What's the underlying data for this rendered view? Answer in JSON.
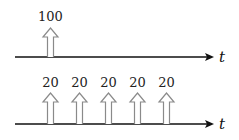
{
  "diagram": {
    "axis_color": "#111111",
    "arrow_stroke": "#8a8a8a",
    "rows": [
      {
        "name": "single-impulse",
        "axis_label": "t",
        "axis_y": 57,
        "impulses": [
          {
            "x": 50,
            "value": "100"
          }
        ]
      },
      {
        "name": "impulse-train",
        "axis_label": "t",
        "axis_y": 124,
        "impulses": [
          {
            "x": 50,
            "value": "20"
          },
          {
            "x": 79,
            "value": "20"
          },
          {
            "x": 108,
            "value": "20"
          },
          {
            "x": 137,
            "value": "20"
          },
          {
            "x": 166,
            "value": "20"
          }
        ]
      }
    ]
  }
}
